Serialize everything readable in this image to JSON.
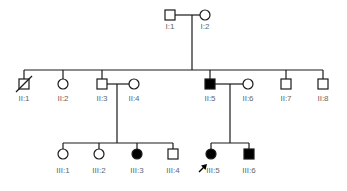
{
  "diagram": {
    "type": "pedigree",
    "colors": {
      "line": "#1a1a1a",
      "affected_fill": "#000000",
      "unaffected_fill": "#ffffff",
      "label": "#666666"
    },
    "generations": {
      "I": [
        {
          "id": "I:1",
          "sex": "male",
          "affected": false,
          "deceased": false
        },
        {
          "id": "I:2",
          "sex": "female",
          "affected": false,
          "deceased": false
        }
      ],
      "II": [
        {
          "id": "II:1",
          "sex": "male",
          "affected": false,
          "deceased": true
        },
        {
          "id": "II:2",
          "sex": "female",
          "affected": false,
          "deceased": false
        },
        {
          "id": "II:3",
          "sex": "male",
          "affected": false,
          "deceased": false
        },
        {
          "id": "II:4",
          "sex": "female",
          "affected": false,
          "deceased": false,
          "married_in": true
        },
        {
          "id": "II:5",
          "sex": "male",
          "affected": true,
          "deceased": false
        },
        {
          "id": "II:6",
          "sex": "female",
          "affected": false,
          "deceased": false,
          "married_in": true
        },
        {
          "id": "II:7",
          "sex": "male",
          "affected": false,
          "deceased": false
        },
        {
          "id": "II:8",
          "sex": "male",
          "affected": false,
          "deceased": false
        }
      ],
      "III": [
        {
          "id": "III:1",
          "sex": "female",
          "affected": false,
          "parents": [
            "II:3",
            "II:4"
          ]
        },
        {
          "id": "III:2",
          "sex": "female",
          "affected": false,
          "parents": [
            "II:3",
            "II:4"
          ]
        },
        {
          "id": "III:3",
          "sex": "female",
          "affected": true,
          "parents": [
            "II:3",
            "II:4"
          ]
        },
        {
          "id": "III:4",
          "sex": "male",
          "affected": false,
          "parents": [
            "II:3",
            "II:4"
          ]
        },
        {
          "id": "III:5",
          "sex": "female",
          "affected": true,
          "proband": true,
          "parents": [
            "II:5",
            "II:6"
          ]
        },
        {
          "id": "III:6",
          "sex": "male",
          "affected": true,
          "parents": [
            "II:5",
            "II:6"
          ]
        }
      ]
    },
    "labels": {
      "I1": "I:1",
      "I2": "I:2",
      "II1": "II:1",
      "II2": "II:2",
      "II3": "II:3",
      "II4": "II:4",
      "II5": "II:5",
      "II6": "II:6",
      "II7": "II:7",
      "II8": "II:8",
      "III1": "III:1",
      "III2": "III:2",
      "III3": "III:3",
      "III4": "III:4",
      "III5": "III:5",
      "III6": "III:6"
    },
    "proband_marker": "arrow"
  }
}
